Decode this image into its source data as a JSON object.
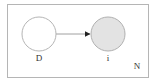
{
  "diagram": {
    "type": "plate-notation",
    "plate": {
      "label": "N",
      "x": 7,
      "y": 4,
      "width": 141,
      "height": 73,
      "stroke": "#b5b5b5"
    },
    "nodes": [
      {
        "id": "D",
        "label": "D",
        "cx": 39,
        "cy": 34,
        "r": 17,
        "fill": "#ffffff",
        "stroke": "#b5b5b5",
        "observed": false
      },
      {
        "id": "i",
        "label": "i",
        "cx": 108,
        "cy": 34,
        "r": 17,
        "fill": "#e3e3e3",
        "stroke": "#b0b0b0",
        "observed": true
      }
    ],
    "edges": [
      {
        "from": "D",
        "to": "i",
        "stroke": "#888888",
        "arrowhead": "#222222"
      }
    ]
  }
}
